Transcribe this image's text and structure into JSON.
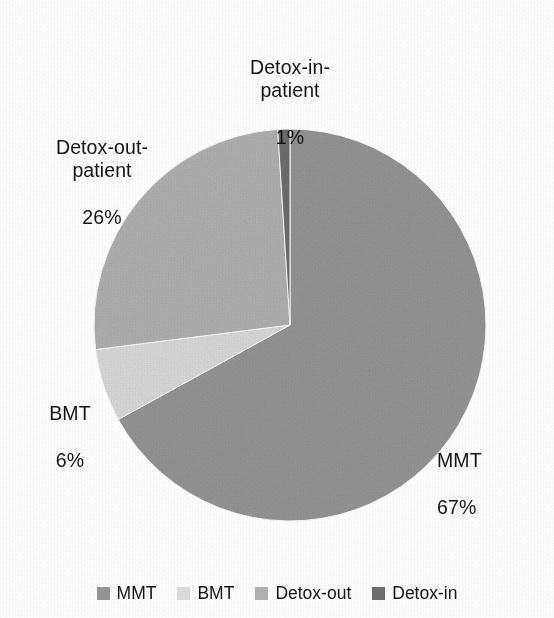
{
  "chart_data": {
    "type": "pie",
    "title": "",
    "subtitle": "",
    "xlabel": "",
    "ylabel": "",
    "grid": false,
    "legend_position": "bottom",
    "units": "percent",
    "start_angle_deg": 0,
    "direction": "clockwise",
    "categories": [
      "MMT",
      "BMT",
      "Detox-out",
      "Detox-in"
    ],
    "values": [
      67,
      6,
      26,
      1
    ],
    "slices": [
      {
        "key": "mmt",
        "legend_label": "MMT",
        "callout_name": "MMT",
        "callout_pct": "67%",
        "value": 67,
        "color": "#969696",
        "start_deg": 0,
        "end_deg": 241.2
      },
      {
        "key": "bmt",
        "legend_label": "BMT",
        "callout_name": "BMT",
        "callout_pct": "6%",
        "value": 6,
        "color": "#dcdcdc",
        "start_deg": 241.2,
        "end_deg": 262.8
      },
      {
        "key": "detox-out",
        "legend_label": "Detox-out",
        "callout_name": "Detox-out-\npatient",
        "callout_pct": "26%",
        "value": 26,
        "color": "#b2b2b2",
        "start_deg": 262.8,
        "end_deg": 356.4
      },
      {
        "key": "detox-in",
        "legend_label": "Detox-in",
        "callout_name": "Detox-in-\npatient",
        "callout_pct": "1%",
        "value": 1,
        "color": "#6f6f6f",
        "start_deg": 356.4,
        "end_deg": 360
      }
    ]
  },
  "labels": {
    "detox_in": {
      "name": "Detox-in-\npatient",
      "pct": "1%"
    },
    "detox_out": {
      "name": "Detox-out-\npatient",
      "pct": "26%"
    },
    "bmt": {
      "name": "BMT",
      "pct": "6%"
    },
    "mmt": {
      "name": "MMT",
      "pct": "67%"
    }
  },
  "legend": {
    "items": [
      {
        "label": "MMT",
        "color": "#969696"
      },
      {
        "label": "BMT",
        "color": "#dcdcdc"
      },
      {
        "label": "Detox-out",
        "color": "#b2b2b2"
      },
      {
        "label": "Detox-in",
        "color": "#6f6f6f"
      }
    ]
  },
  "geometry": {
    "cx": 290,
    "cy": 325,
    "r": 196
  }
}
